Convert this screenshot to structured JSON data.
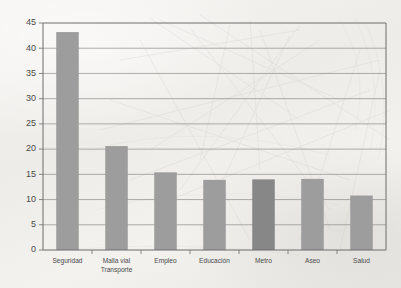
{
  "chart_data": {
    "type": "bar",
    "title": "",
    "subtitle": "",
    "xlabel": "",
    "ylabel": "",
    "categories": [
      "Seguridad",
      "Malla vial Transporte",
      "Empleo",
      "Educación",
      "Metro",
      "Aseo",
      "Salud"
    ],
    "category_lines": [
      [
        "Seguridad"
      ],
      [
        "Malla vial",
        "Transporte"
      ],
      [
        "Empleo"
      ],
      [
        "Educación"
      ],
      [
        "Metro"
      ],
      [
        "Aseo"
      ],
      [
        "Salud"
      ]
    ],
    "values": [
      43.2,
      20.6,
      15.4,
      13.9,
      14.0,
      14.1,
      10.8
    ],
    "ylim": [
      0,
      45
    ],
    "ytick_values": [
      0,
      5,
      10,
      15,
      20,
      25,
      30,
      35,
      40,
      45
    ],
    "ytick_labels": [
      "0",
      "5",
      "10",
      "15",
      "20",
      "25",
      "30",
      "35",
      "40",
      "45"
    ],
    "grid": true,
    "grid_axis": "y",
    "legend": false,
    "legend_position": "none",
    "bar_color": "#9d9d9d",
    "highlight_bar_color": "#878787",
    "highlight_category": "Metro",
    "axis_color": "#6d6d6d",
    "grid_color": "#8d8d8d",
    "label_color": "#4a4a4a",
    "background_color": "#f2f1ef"
  }
}
